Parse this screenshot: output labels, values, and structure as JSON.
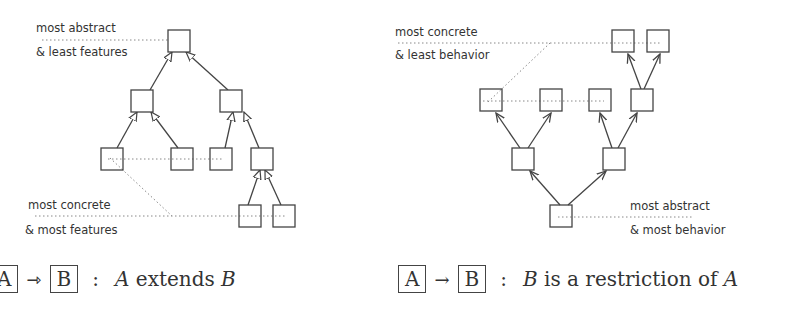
{
  "left_diagram": {
    "label_top": [
      "most abstract",
      "& least features"
    ],
    "label_bottom": [
      "most concrete",
      "& most features"
    ],
    "legend": {
      "from": "A",
      "to": "B",
      "arrow": "⇾",
      "colon": ":",
      "text_a": "A",
      "text_mid": " extends ",
      "text_b": "B"
    },
    "edge_style": "hollow-triangle (inheritance)"
  },
  "right_diagram": {
    "label_top": [
      "most concrete",
      "& least behavior"
    ],
    "label_bottom": [
      "most abstract",
      "& most behavior"
    ],
    "legend": {
      "from": "A",
      "to": "B",
      "arrow": "→",
      "colon": ":",
      "text_b": "B",
      "text_mid": " is a restriction of ",
      "text_a": "A"
    },
    "edge_style": "open-arrowhead"
  },
  "colors": {
    "line": "#444444",
    "dotted": "#888888",
    "text": "#333333"
  }
}
